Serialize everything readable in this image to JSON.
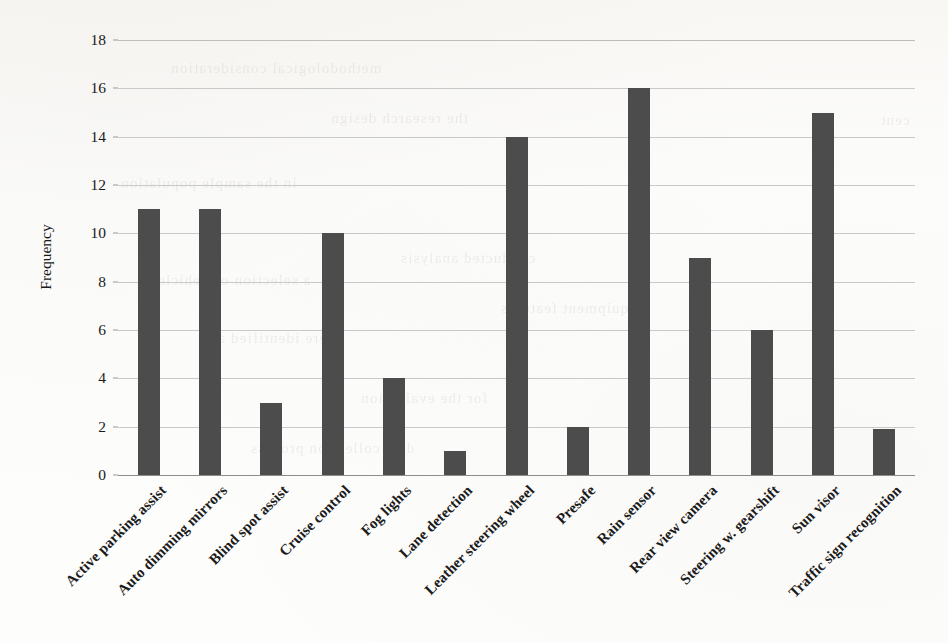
{
  "chart_data": {
    "type": "bar",
    "title": "",
    "subtitle": "",
    "xlabel": "",
    "ylabel": "Frequency",
    "ylim": [
      0,
      18
    ],
    "ytick_step": 2,
    "yticks": [
      "18",
      "16",
      "14",
      "12",
      "10",
      "8",
      "6",
      "4",
      "2",
      "0"
    ],
    "grid": true,
    "legend": false,
    "legend_position": "none",
    "bar_color": "#4c4c4c",
    "gridline_color": "#c9c9c9",
    "background_color": "#fdfdfc",
    "categories": [
      "Active parking assist",
      "Auto dimming mirrors",
      "Blind spot assist",
      "Cruise control",
      "Fog lights",
      "Lane detection",
      "Leather steering wheel",
      "Presafe",
      "Rain sensor",
      "Rear view camera",
      "Steering w. gearshift",
      "Sun visor",
      "Traffic sign recognition"
    ],
    "values": [
      11,
      11,
      3,
      10,
      4,
      1,
      14,
      2,
      16,
      9,
      6,
      15,
      1.9
    ]
  },
  "ghost_text": {
    "lines": [
      "methodological consideration",
      "the research design",
      "in the sample population",
      "conducted analysis",
      "a selection of vehicles",
      "equipment features",
      "were identified as",
      "for the evaluation",
      "cent",
      "data collection process"
    ]
  }
}
